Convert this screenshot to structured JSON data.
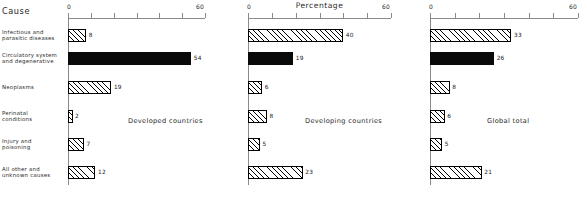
{
  "header": {
    "cause_label": "Cause"
  },
  "categories": [
    "Infectious and parasitic diseases",
    "Circulatory system and degenerative",
    "Neoplasms",
    "Perinatal conditions",
    "Injury and poisoning",
    "All other and unknown causes"
  ],
  "category_lines": [
    [
      "Infectious and",
      "parasitic diseases"
    ],
    [
      "Circulatory system",
      "and degenerative"
    ],
    [
      "Neoplasms"
    ],
    [
      "Perinatal",
      "conditions"
    ],
    [
      "Injury and",
      "poisoning"
    ],
    [
      "All other and",
      "unknown causes"
    ]
  ],
  "axis": {
    "min_label": "0",
    "max_label": "60",
    "min": 0,
    "max": 60,
    "tick_step": 10,
    "title": "Percentage"
  },
  "panels": [
    {
      "caption": "Developed countries",
      "values": [
        8,
        54,
        19,
        2,
        7,
        12
      ],
      "value_labels": [
        "8",
        "54",
        "19",
        "2",
        "7",
        "12"
      ]
    },
    {
      "caption": "Developing countries",
      "values": [
        40,
        19,
        6,
        8,
        5,
        23
      ],
      "value_labels": [
        "40",
        "19",
        "6",
        "8",
        "5",
        "23"
      ]
    },
    {
      "caption": "Global total",
      "values": [
        33,
        26,
        8,
        6,
        5,
        21
      ],
      "value_labels": [
        "33",
        "26",
        "8",
        "6",
        "5",
        "21"
      ]
    }
  ],
  "style": {
    "solid_row_index": 1,
    "bar_fill_hatch": "#ffffff",
    "bar_fill_solid": "#0a0a0a",
    "bar_stroke": "#000000",
    "axis_color": "#8a8a8a",
    "text_color": "#2a2a2a",
    "background": "#ffffff"
  },
  "chart_data": {
    "type": "bar",
    "orientation": "horizontal",
    "title": "",
    "xlabel": "Percentage",
    "ylabel": "Cause",
    "xlim": [
      0,
      60
    ],
    "xticks": [
      0,
      10,
      20,
      30,
      40,
      50,
      60
    ],
    "xtick_labels_shown": [
      "0",
      "60"
    ],
    "grid": false,
    "legend": "none",
    "panel_layout": "three side-by-side panels sharing category axis",
    "categories": [
      "Infectious and parasitic diseases",
      "Circulatory system and degenerative",
      "Neoplasms",
      "Perinatal conditions",
      "Injury and poisoning",
      "All other and unknown causes"
    ],
    "series": [
      {
        "name": "Developed countries",
        "values": [
          8,
          54,
          19,
          2,
          7,
          12
        ]
      },
      {
        "name": "Developing countries",
        "values": [
          40,
          19,
          6,
          8,
          5,
          23
        ]
      },
      {
        "name": "Global total",
        "values": [
          33,
          26,
          8,
          6,
          5,
          21
        ]
      }
    ],
    "annotations": [
      "Each bar is labelled with its percentage value at the bar end",
      "Circulatory system and degenerative bars are filled solid black; all other bars use diagonal hatching"
    ]
  }
}
